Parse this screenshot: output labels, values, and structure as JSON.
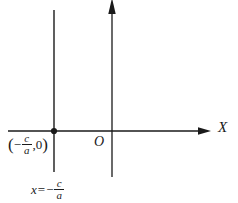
{
  "figure": {
    "background_color": "#ffffff",
    "stroke_color": "#1a1a1a",
    "width": 238,
    "height": 203
  },
  "axes": {
    "x_axis": {
      "label": "X",
      "y_pixel": 131,
      "x_start": 8,
      "x_end": 210,
      "arrow": "right"
    },
    "y_axis": {
      "label": "",
      "x_pixel": 112,
      "y_top": 0,
      "y_bottom": 177,
      "arrow": "up"
    },
    "origin": {
      "label": "O",
      "x_pixel": 112,
      "y_pixel": 131
    }
  },
  "line": {
    "name": "vertical-asymptote",
    "x_pixel": 54,
    "y_top": 10,
    "y_bottom": 172,
    "equation": {
      "variable": "x",
      "equals": "=",
      "minus": "−",
      "numerator": "c",
      "denominator": "a"
    }
  },
  "point": {
    "name": "x-intercept",
    "x_pixel": 54,
    "y_pixel": 131,
    "marker": "filled-dot",
    "label": {
      "open_paren": "(",
      "minus": "−",
      "numerator": "c",
      "denominator": "a",
      "comma_zero": ",0",
      "close_paren": ")"
    }
  }
}
